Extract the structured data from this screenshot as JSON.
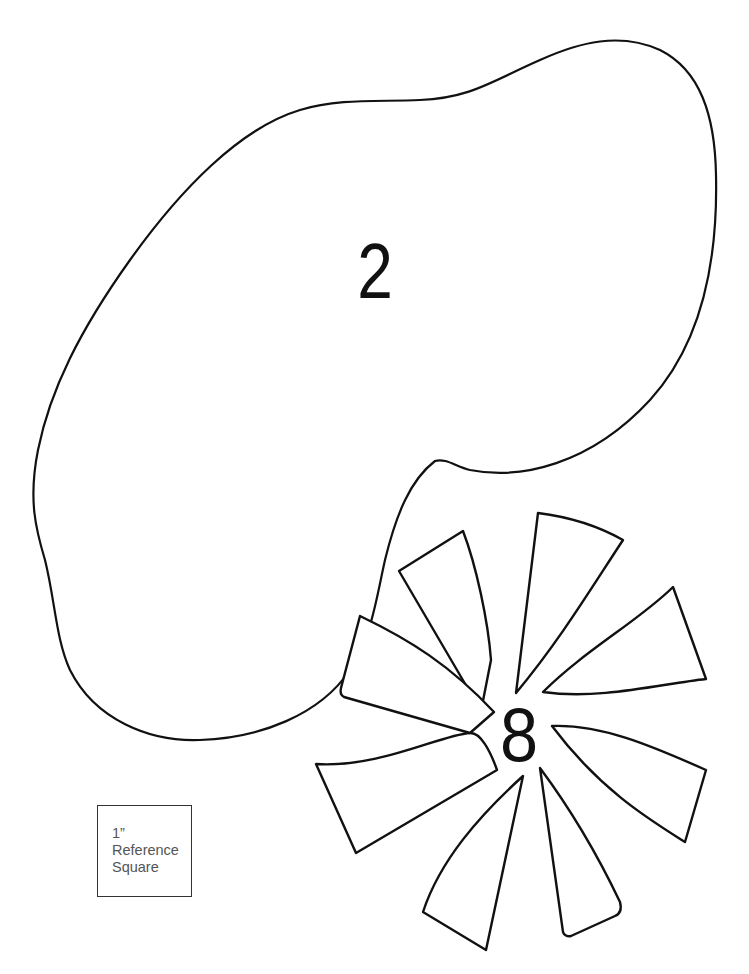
{
  "page": {
    "background": "#ffffff",
    "stroke_color": "#111111"
  },
  "shapes": [
    {
      "id": "blob",
      "label": "2",
      "type": "organic-blob-outline"
    },
    {
      "id": "pinwheel",
      "label": "8",
      "type": "eight-petal-pinwheel-outline",
      "petal_count": 8
    }
  ],
  "labels": {
    "blob_number": "2",
    "pinwheel_number": "8"
  },
  "reference_square": {
    "line1": "1”",
    "line2": "Reference",
    "line3": "Square",
    "border_color": "#333333",
    "text_color": "#555555"
  }
}
